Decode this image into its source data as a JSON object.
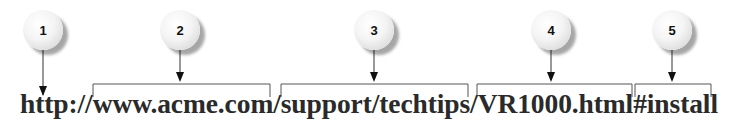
{
  "diagram": {
    "url_text": "http://www.acme.com/support/techtips/VR1000.html#install",
    "callouts": [
      {
        "label": "1",
        "segment": "http://"
      },
      {
        "label": "2",
        "segment": "www.acme.com"
      },
      {
        "label": "3",
        "segment": "support/techtips"
      },
      {
        "label": "4",
        "segment": "VR1000.html"
      },
      {
        "label": "5",
        "segment": "#install"
      }
    ]
  }
}
